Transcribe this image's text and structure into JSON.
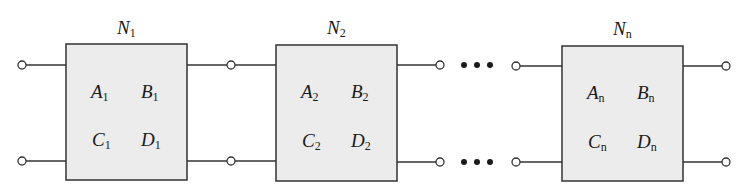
{
  "diagram": {
    "colors": {
      "box_fill": "#ececec",
      "stroke": "#333333",
      "text": "#1a1a1a",
      "background": "#ffffff"
    },
    "networks": [
      {
        "name": "N",
        "sub": "1",
        "params": [
          {
            "sym": "A",
            "sub": "1"
          },
          {
            "sym": "B",
            "sub": "1"
          },
          {
            "sym": "C",
            "sub": "1"
          },
          {
            "sym": "D",
            "sub": "1"
          }
        ]
      },
      {
        "name": "N",
        "sub": "2",
        "params": [
          {
            "sym": "A",
            "sub": "2"
          },
          {
            "sym": "B",
            "sub": "2"
          },
          {
            "sym": "C",
            "sub": "2"
          },
          {
            "sym": "D",
            "sub": "2"
          }
        ]
      },
      {
        "name": "N",
        "sub": "n",
        "params": [
          {
            "sym": "A",
            "sub": "n"
          },
          {
            "sym": "B",
            "sub": "n"
          },
          {
            "sym": "C",
            "sub": "n"
          },
          {
            "sym": "D",
            "sub": "n"
          }
        ]
      }
    ],
    "ellipsis": "• • •"
  }
}
